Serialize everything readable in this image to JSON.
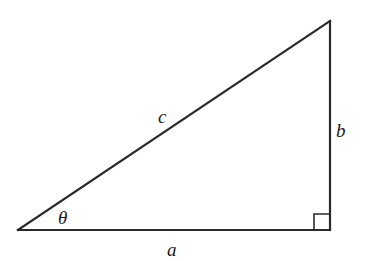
{
  "diagram": {
    "type": "right-triangle",
    "vertices": {
      "left": {
        "x": 18,
        "y": 230
      },
      "bottom_right": {
        "x": 330,
        "y": 230
      },
      "top_right": {
        "x": 330,
        "y": 21
      }
    },
    "labels": {
      "hypotenuse": "c",
      "vertical_leg": "b",
      "horizontal_leg": "a",
      "angle": "θ"
    },
    "right_angle_marker": {
      "size": 16
    },
    "colors": {
      "stroke": "#2a2a2a",
      "text": "#1a1a1a",
      "background": "#ffffff"
    }
  }
}
